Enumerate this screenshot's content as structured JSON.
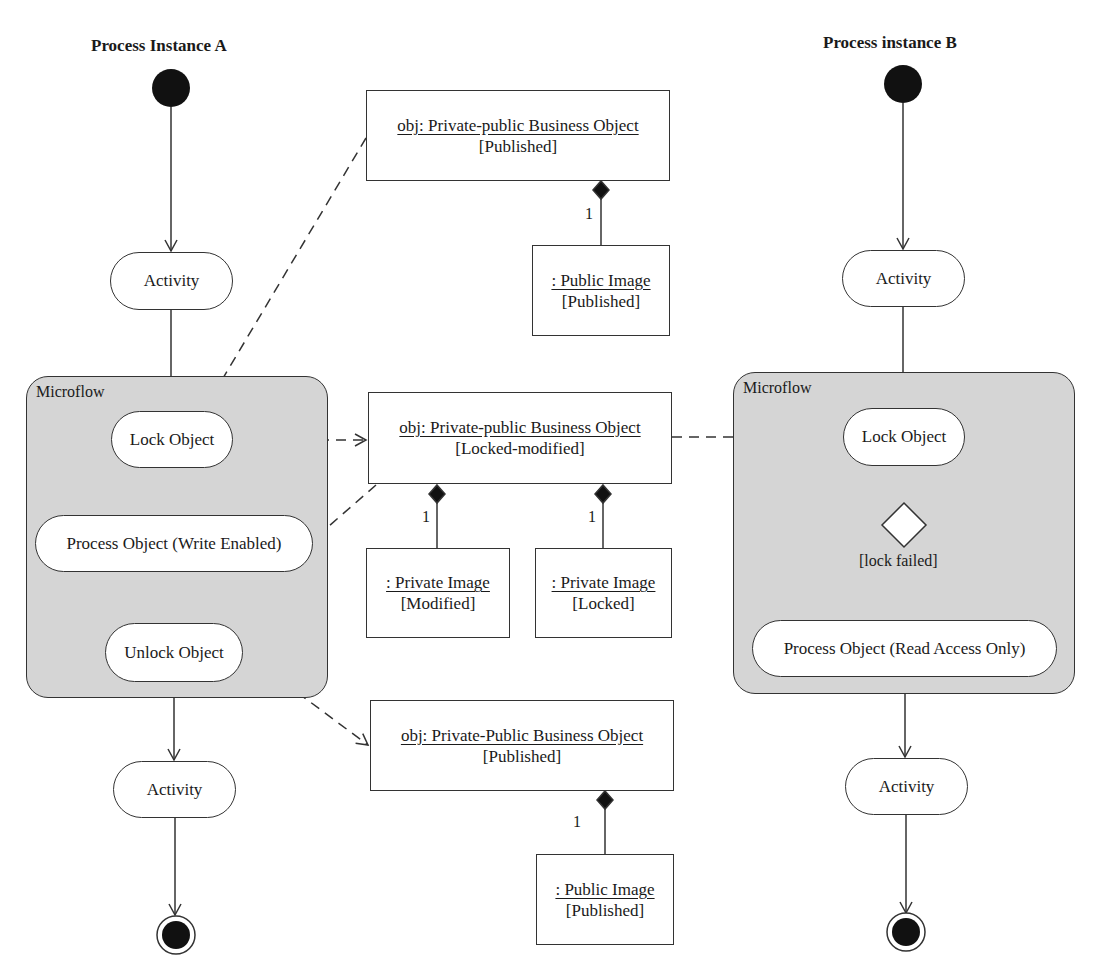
{
  "diagram": {
    "type": "UML activity diagram with object flows",
    "colors": {
      "microflow_fill": "#d5d5d5",
      "line": "#333333",
      "node_fill": "#ffffff",
      "initial_final": "#000000"
    }
  },
  "lanes": {
    "a": {
      "title": "Process Instance A",
      "activity_top": "Activity",
      "microflow": {
        "label": "Microflow",
        "lock": "Lock Object",
        "process": "Process Object (Write Enabled)",
        "unlock": "Unlock Object"
      },
      "activity_bottom": "Activity"
    },
    "b": {
      "title": "Process instance B",
      "activity_top": "Activity",
      "microflow": {
        "label": "Microflow",
        "lock": "Lock Object",
        "guard": "[lock failed]",
        "process": "Process Object (Read Access Only)"
      },
      "activity_bottom": "Activity"
    }
  },
  "objects": {
    "top": {
      "name": "obj: Private-public Business Object",
      "state": "[Published]",
      "part": {
        "name": ": Public Image",
        "state": "[Published]",
        "multiplicity": "1"
      }
    },
    "middle": {
      "name": "obj: Private-public Business Object",
      "state": "[Locked-modified]",
      "parts": [
        {
          "name": ": Private Image",
          "state": "[Modified]",
          "multiplicity": "1"
        },
        {
          "name": ": Private Image",
          "state": "[Locked]",
          "multiplicity": "1"
        }
      ]
    },
    "bottom": {
      "name": "obj: Private-Public Business Object",
      "state": "[Published]",
      "part": {
        "name": ": Public Image",
        "state": "[Published]",
        "multiplicity": "1"
      }
    }
  }
}
